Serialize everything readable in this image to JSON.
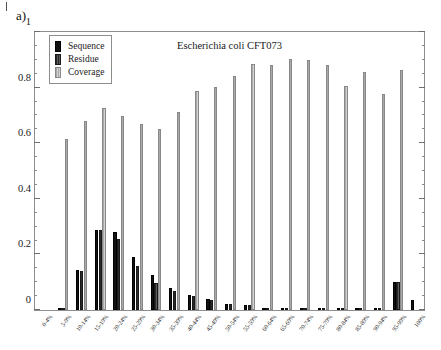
{
  "panel": {
    "label": "a)"
  },
  "chart_data": {
    "type": "bar",
    "title": "Escherichia coli CFT073",
    "xlabel": "",
    "ylabel": "",
    "ylim": [
      0,
      1
    ],
    "ytick_labels": [
      "0",
      "0.2",
      "0.4",
      "0.6",
      "0.8",
      "1"
    ],
    "ytick_values": [
      0,
      0.2,
      0.4,
      0.6,
      0.8,
      1
    ],
    "yminor_step": 0.05,
    "grid": false,
    "legend_position": "upper-left",
    "categories": [
      "0-4%",
      "5-9%",
      "10-14%",
      "15-19%",
      "20-24%",
      "25-29%",
      "30-34%",
      "35-39%",
      "40-44%",
      "45-49%",
      "50-54%",
      "55-59%",
      "60-64%",
      "65-69%",
      "70-74%",
      "75-79%",
      "80-84%",
      "85-89%",
      "90-94%",
      "95-99%",
      "100%"
    ],
    "series": [
      {
        "name": "Sequence",
        "color": "#121212",
        "values": [
          0.0,
          0.003,
          0.142,
          0.286,
          0.277,
          0.191,
          0.124,
          0.077,
          0.054,
          0.038,
          0.023,
          0.019,
          0.008,
          0.006,
          0.004,
          0.004,
          0.002,
          0.003,
          0.002,
          0.101,
          0.036
        ]
      },
      {
        "name": "Residue",
        "color": "#3d3d3d",
        "values": [
          0.0,
          0.002,
          0.14,
          0.284,
          0.254,
          0.157,
          0.097,
          0.067,
          0.05,
          0.037,
          0.02,
          0.017,
          0.007,
          0.005,
          0.003,
          0.003,
          0.002,
          0.002,
          0.002,
          0.099,
          0.0
        ]
      },
      {
        "name": "Coverage",
        "color": "#bdbdbd",
        "values": [
          0.0,
          0.61,
          0.675,
          0.722,
          0.694,
          0.664,
          0.648,
          0.706,
          0.781,
          0.798,
          0.834,
          0.878,
          0.874,
          0.898,
          0.894,
          0.874,
          0.801,
          0.849,
          0.771,
          0.856,
          0.0
        ]
      }
    ]
  }
}
